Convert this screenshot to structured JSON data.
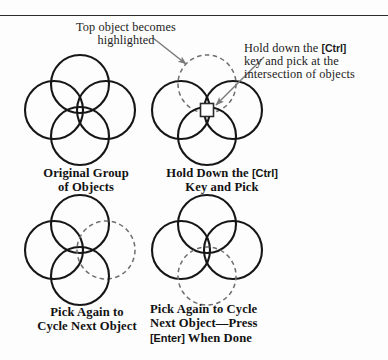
{
  "figure": {
    "background_color": "#fdfdfd",
    "ink_color": "#1a1a1a",
    "dashed_color": "#6b6b6b",
    "arrow_color": "#7a7a7a",
    "rule_color": "#2b2b2b"
  },
  "annotations": [
    {
      "name": "top-object-highlighted",
      "lines": [
        "Top object becomes",
        "highlighted"
      ],
      "align": "center"
    },
    {
      "name": "hold-ctrl-pick-intersection",
      "lines": [
        "Hold down the [Ctrl]",
        "key and pick at the",
        "intersection of objects"
      ],
      "align": "left"
    }
  ],
  "callouts": {
    "top": {
      "line1": "Top object becomes",
      "line2": "highlighted"
    },
    "right": {
      "line1_pre": "Hold down the ",
      "line1_key": "[Ctrl]",
      "line2": "key and pick at the",
      "line3": "intersection of objects"
    }
  },
  "captions": {
    "original": {
      "line1": "Original Group",
      "line2": "of Objects"
    },
    "holdctrl": {
      "line1_pre": "Hold Down the ",
      "line1_key": "[Ctrl]",
      "line2": "Key and Pick"
    },
    "pickagain": {
      "line1": "Pick Again to",
      "line2": "Cycle Next Object"
    },
    "pickcycle": {
      "line1": "Pick Again to Cycle",
      "line2": "Next Object—Press",
      "line3_key": "[Enter]",
      "line3_post": " When Done"
    }
  },
  "diagrams": [
    {
      "name": "original-group-of-objects",
      "center": [
        80,
        110
      ],
      "radius": 29,
      "offset": 26,
      "highlighted": "none",
      "pickbox": false
    },
    {
      "name": "hold-ctrl-key-and-pick",
      "center": [
        207,
        110
      ],
      "radius": 29,
      "offset": 26,
      "highlighted": "top",
      "pickbox": true
    },
    {
      "name": "pick-again-cycle-next-object",
      "center": [
        80,
        250
      ],
      "radius": 29,
      "offset": 26,
      "highlighted": "right",
      "pickbox": false
    },
    {
      "name": "pick-again-cycle-next-object-press-enter",
      "center": [
        207,
        250
      ],
      "radius": 29,
      "offset": 26,
      "highlighted": "bottom",
      "pickbox": false
    }
  ]
}
